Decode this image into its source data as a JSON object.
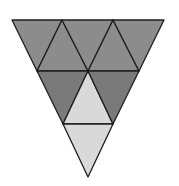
{
  "diagram": {
    "colors": {
      "background": "#ffffff",
      "upper": "#8c8c8c",
      "middle_dark": "#7a7a7a",
      "light": "#d9d9d9",
      "stroke": "#1e1e1e"
    },
    "triangles": [
      {
        "id": "r1-a",
        "points": "12,20 62,20 37,71",
        "fill": "upper"
      },
      {
        "id": "r1-b",
        "points": "62,20 37,71 88,71",
        "fill": "upper"
      },
      {
        "id": "r1-c",
        "points": "62,20 113,20 88,71",
        "fill": "upper"
      },
      {
        "id": "r1-d",
        "points": "113,20 88,71 139,71",
        "fill": "upper"
      },
      {
        "id": "r1-e",
        "points": "113,20 164,20 139,71",
        "fill": "upper"
      },
      {
        "id": "r2-a",
        "points": "37,71 88,71 63,124",
        "fill": "middle_dark"
      },
      {
        "id": "r2-b",
        "points": "88,71 63,124 113,124",
        "fill": "light"
      },
      {
        "id": "r2-c",
        "points": "88,71 139,71 113,124",
        "fill": "middle_dark"
      },
      {
        "id": "r3-a",
        "points": "63,124 113,124 88,177",
        "fill": "light"
      }
    ]
  }
}
